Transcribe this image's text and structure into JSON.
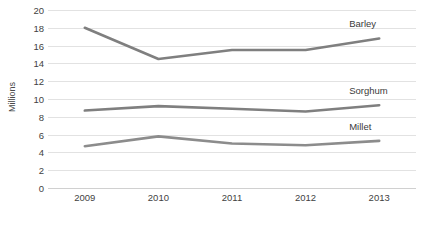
{
  "chart_data": {
    "type": "line",
    "title": "",
    "xlabel": "",
    "ylabel": "Millions",
    "categories": [
      "2009",
      "2010",
      "2011",
      "2012",
      "2013"
    ],
    "x": [
      2009,
      2010,
      2011,
      2012,
      2013
    ],
    "ylim": [
      0,
      20
    ],
    "y_ticks": [
      0,
      2,
      4,
      6,
      8,
      10,
      12,
      14,
      16,
      18,
      20
    ],
    "grid": true,
    "legend_position": "inline-right-end-labels",
    "series": [
      {
        "name": "Barley",
        "values": [
          18.0,
          14.5,
          15.5,
          15.5,
          16.8
        ],
        "color": "#7f7f7f"
      },
      {
        "name": "Sorghum",
        "values": [
          8.7,
          9.2,
          8.9,
          8.6,
          9.3
        ],
        "color": "#7f7f7f"
      },
      {
        "name": "Millet",
        "values": [
          4.7,
          5.8,
          5.0,
          4.8,
          5.3
        ],
        "color": "#8c8c8c"
      }
    ]
  },
  "axis": {
    "y_title": "Millions",
    "y_tick_labels": [
      "20",
      "18",
      "16",
      "14",
      "12",
      "10",
      "8",
      "6",
      "4",
      "2",
      "0"
    ],
    "x_tick_labels": [
      "2009",
      "2010",
      "2011",
      "2012",
      "2013"
    ]
  },
  "series_labels": {
    "barley": "Barley",
    "sorghum": "Sorghum",
    "millet": "Millet"
  },
  "colors": {
    "line": "#7f7f7f",
    "grid": "#e2e2e2",
    "text": "#3a3a3a",
    "background": "#ffffff"
  }
}
